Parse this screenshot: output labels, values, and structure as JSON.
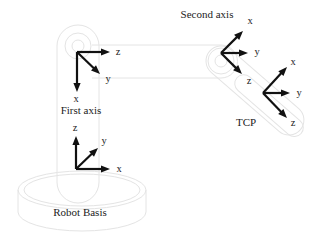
{
  "diagram": {
    "type": "robot-kinematics-coordinate-frames",
    "colors": {
      "arrow": "#111111",
      "label": "#1c1c1c",
      "structure": "#e4e4e4",
      "background": "#ffffff"
    },
    "captions": {
      "second_axis": "Second axis",
      "first_axis": "First axis",
      "tcp": "TCP",
      "robot_basis": "Robot Basis"
    },
    "frames": [
      {
        "id": "first-axis-frame",
        "axes": [
          {
            "label": "z"
          },
          {
            "label": "y"
          },
          {
            "label": "x"
          }
        ]
      },
      {
        "id": "robot-basis-frame",
        "axes": [
          {
            "label": "z"
          },
          {
            "label": "y"
          },
          {
            "label": "x"
          }
        ]
      },
      {
        "id": "second-axis-frame",
        "axes": [
          {
            "label": "x"
          },
          {
            "label": "y"
          },
          {
            "label": "z"
          }
        ]
      },
      {
        "id": "tcp-frame",
        "axes": [
          {
            "label": "x"
          },
          {
            "label": "y"
          },
          {
            "label": "z"
          }
        ]
      }
    ]
  }
}
